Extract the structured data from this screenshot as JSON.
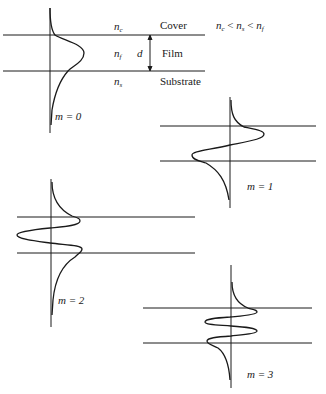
{
  "diagram": {
    "layers": [
      {
        "symbol": "n",
        "subscript": "c",
        "name": "Cover"
      },
      {
        "symbol": "n",
        "subscript": "f",
        "name": "Film"
      },
      {
        "symbol": "n",
        "subscript": "s",
        "name": "Substrate"
      }
    ],
    "thickness_label": "d",
    "condition": {
      "n1": "n",
      "s1": "c",
      "op1": " < ",
      "n2": "n",
      "s2": "s",
      "op2": " < ",
      "n3": "n",
      "s3": "f"
    },
    "modes": [
      {
        "label": "m = 0",
        "order": 0
      },
      {
        "label": "m = 1",
        "order": 1
      },
      {
        "label": "m = 2",
        "order": 2
      },
      {
        "label": "m = 3",
        "order": 3
      }
    ],
    "colors": {
      "line": "#1a1a1a",
      "background": "#ffffff"
    }
  }
}
